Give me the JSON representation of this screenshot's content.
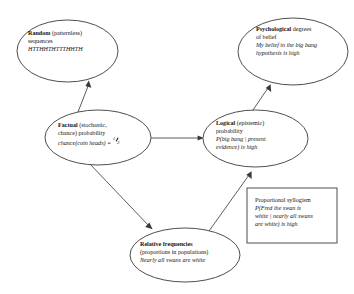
{
  "diagram": {
    "type": "concept-map",
    "nodes": [
      {
        "id": "random",
        "shape": "ellipse",
        "lines": [
          {
            "segments": [
              {
                "text": "Random",
                "style": "bold"
              },
              {
                "text": " (patternless)",
                "style": "plain"
              }
            ]
          },
          {
            "segments": [
              {
                "text": "sequences",
                "style": "plain"
              }
            ]
          },
          {
            "segments": [
              {
                "text": "HTTHHTHTTTHHTH",
                "style": "italic"
              }
            ]
          }
        ]
      },
      {
        "id": "psychological",
        "shape": "ellipse",
        "lines": [
          {
            "segments": [
              {
                "text": "Psychological",
                "style": "bold"
              },
              {
                "text": " degrees",
                "style": "plain"
              }
            ]
          },
          {
            "segments": [
              {
                "text": "of belief",
                "style": "plain"
              }
            ]
          },
          {
            "segments": [
              {
                "text": "My belief in the big bang",
                "style": "italic"
              }
            ]
          },
          {
            "segments": [
              {
                "text": "hypothesis is high",
                "style": "italic"
              }
            ]
          }
        ]
      },
      {
        "id": "factual",
        "shape": "ellipse",
        "lines": [
          {
            "segments": [
              {
                "text": "Factual",
                "style": "bold"
              },
              {
                "text": " (stochastic,",
                "style": "plain"
              }
            ]
          },
          {
            "segments": [
              {
                "text": "chance) probability",
                "style": "plain"
              }
            ]
          },
          {
            "segments": [
              {
                "text": "chance(coin heads) = ",
                "style": "italic"
              },
              {
                "text": "1/2",
                "style": "fraction",
                "numerator": "1",
                "denominator": "2"
              }
            ]
          }
        ]
      },
      {
        "id": "logical",
        "shape": "ellipse",
        "lines": [
          {
            "segments": [
              {
                "text": "Logical",
                "style": "bold"
              },
              {
                "text": " (epistemic)",
                "style": "plain"
              }
            ]
          },
          {
            "segments": [
              {
                "text": "probability",
                "style": "plain"
              }
            ]
          },
          {
            "segments": [
              {
                "text": "P(big bang | present",
                "style": "italic"
              }
            ]
          },
          {
            "segments": [
              {
                "text": "evidence) is high",
                "style": "italic"
              }
            ]
          }
        ]
      },
      {
        "id": "relative-frequencies",
        "shape": "ellipse",
        "lines": [
          {
            "segments": [
              {
                "text": "Relative frequencies",
                "style": "bold"
              }
            ]
          },
          {
            "segments": [
              {
                "text": "(proportions in populations)",
                "style": "plain"
              }
            ]
          },
          {
            "segments": [
              {
                "text": "Nearly all swans are white",
                "style": "italic"
              }
            ]
          }
        ]
      },
      {
        "id": "proportional-syllogism",
        "shape": "rectangle",
        "lines": [
          {
            "segments": [
              {
                "text": "Proportional syllogism",
                "style": "plain"
              }
            ]
          },
          {
            "segments": [
              {
                "text": "P(Fred the swan is",
                "style": "italic"
              }
            ]
          },
          {
            "segments": [
              {
                "text": "white | nearly all swans",
                "style": "italic"
              }
            ]
          },
          {
            "segments": [
              {
                "text": "are white) is high",
                "style": "italic"
              }
            ]
          }
        ]
      }
    ],
    "edges": [
      {
        "id": "factual-to-random",
        "from": "factual",
        "to": "random",
        "arrow": "single"
      },
      {
        "id": "factual-to-logical",
        "from": "factual",
        "to": "logical",
        "arrow": "single"
      },
      {
        "id": "factual-to-relative-frequencies",
        "from": "factual",
        "to": "relative-frequencies",
        "arrow": "single"
      },
      {
        "id": "logical-to-psychological",
        "from": "logical",
        "to": "psychological",
        "arrow": "single"
      },
      {
        "id": "relative-frequencies-to-logical",
        "from": "relative-frequencies",
        "to": "logical",
        "arrow": "single"
      }
    ],
    "colors": {
      "background": "#ffffff",
      "stroke": "#3a3a3a",
      "text": "#141414"
    }
  }
}
